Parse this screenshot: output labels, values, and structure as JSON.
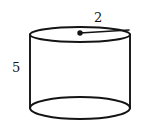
{
  "figure": {
    "name": "cylinder",
    "background_color": "#ffffff",
    "stroke_color": "#141414",
    "labels": {
      "radius": "2",
      "height": "5"
    },
    "geometry": {
      "top_ellipse": {
        "cx": 80,
        "cy": 34.5,
        "rx": 50,
        "ry": 7.5
      },
      "bottom_ellipse": {
        "cx": 80,
        "cy": 108,
        "rx": 50,
        "ry": 11
      },
      "left_side": {
        "x": 30,
        "y1": 34.5,
        "y2": 108
      },
      "right_side": {
        "x": 130,
        "y1": 34.5,
        "y2": 108
      },
      "center_dot": {
        "cx": 80,
        "cy": 33,
        "r": 2.6
      },
      "radius_line": {
        "x1": 80,
        "y1": 33,
        "x2": 129,
        "y2": 29.5
      }
    }
  }
}
